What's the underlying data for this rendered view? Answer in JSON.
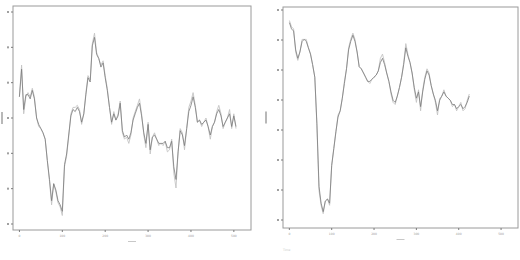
{
  "chart_data": [
    {
      "type": "line",
      "title": "",
      "xlabel": "",
      "ylabel": "",
      "x_ticks": [
        "0",
        "100",
        "200",
        "300",
        "400",
        "500"
      ],
      "xlim": [
        -15,
        540
      ],
      "ylim_pixel_ticks": 7,
      "grid": false,
      "legend": null,
      "series": [
        {
          "name": "series-light",
          "color": "#c4c4c4",
          "x": [
            0,
            5,
            10,
            15,
            20,
            25,
            30,
            35,
            40,
            45,
            50,
            55,
            60,
            65,
            70,
            75,
            80,
            85,
            90,
            95,
            100,
            105,
            110,
            115,
            120,
            125,
            130,
            135,
            140,
            145,
            150,
            155,
            160,
            165,
            170,
            175,
            180,
            185,
            190,
            195,
            200,
            205,
            210,
            215,
            220,
            225,
            230,
            235,
            240,
            245,
            250,
            255,
            260,
            265,
            270,
            275,
            280,
            285,
            290,
            295,
            300,
            305,
            310,
            315,
            320,
            325,
            330,
            335,
            340,
            345,
            350,
            355,
            360,
            365,
            370,
            375,
            380,
            385,
            390,
            395,
            400,
            405,
            410,
            415,
            420,
            425,
            430,
            435,
            440,
            445,
            450,
            455,
            460,
            465,
            470,
            475,
            480,
            485,
            490,
            495,
            500,
            505,
            510,
            515,
            520,
            525
          ],
          "y": [
            0.6,
            0.75,
            0.52,
            0.6,
            0.62,
            0.6,
            0.64,
            0.6,
            0.5,
            0.46,
            0.45,
            0.43,
            0.4,
            0.3,
            0.2,
            0.09,
            0.19,
            0.15,
            0.1,
            0.08,
            0.04,
            0.27,
            0.32,
            0.41,
            0.52,
            0.55,
            0.55,
            0.56,
            0.54,
            0.47,
            0.52,
            0.62,
            0.7,
            0.68,
            0.85,
            0.9,
            0.81,
            0.78,
            0.75,
            0.77,
            0.7,
            0.64,
            0.55,
            0.47,
            0.53,
            0.49,
            0.52,
            0.58,
            0.43,
            0.4,
            0.41,
            0.38,
            0.42,
            0.5,
            0.53,
            0.56,
            0.59,
            0.52,
            0.42,
            0.36,
            0.48,
            0.33,
            0.41,
            0.43,
            0.4,
            0.37,
            0.38,
            0.37,
            0.39,
            0.34,
            0.35,
            0.4,
            0.24,
            0.17,
            0.34,
            0.45,
            0.43,
            0.35,
            0.45,
            0.55,
            0.58,
            0.62,
            0.56,
            0.48,
            0.49,
            0.46,
            0.48,
            0.5,
            0.46,
            0.4,
            0.46,
            0.48,
            0.53,
            0.56,
            0.52,
            0.45,
            0.48,
            0.5,
            0.54,
            0.45,
            0.52,
            0.45
          ]
        },
        {
          "name": "series-dark",
          "color": "#7b7b7b",
          "x": [
            0,
            5,
            10,
            15,
            20,
            25,
            30,
            35,
            40,
            45,
            50,
            55,
            60,
            65,
            70,
            75,
            80,
            85,
            90,
            95,
            100,
            105,
            110,
            115,
            120,
            125,
            130,
            135,
            140,
            145,
            150,
            155,
            160,
            165,
            170,
            175,
            180,
            185,
            190,
            195,
            200,
            205,
            210,
            215,
            220,
            225,
            230,
            235,
            240,
            245,
            250,
            255,
            260,
            265,
            270,
            275,
            280,
            285,
            290,
            295,
            300,
            305,
            310,
            315,
            320,
            325,
            330,
            335,
            340,
            345,
            350,
            355,
            360,
            365,
            370,
            375,
            380,
            385,
            390,
            395,
            400,
            405,
            410,
            415,
            420,
            425,
            430,
            435,
            440,
            445,
            450,
            455,
            460,
            465,
            470,
            475,
            480,
            485,
            490,
            495,
            500,
            505,
            510,
            515,
            520,
            525
          ],
          "y": [
            0.6,
            0.73,
            0.54,
            0.61,
            0.61,
            0.59,
            0.63,
            0.59,
            0.5,
            0.47,
            0.45,
            0.43,
            0.4,
            0.3,
            0.21,
            0.11,
            0.19,
            0.16,
            0.11,
            0.09,
            0.06,
            0.28,
            0.33,
            0.42,
            0.51,
            0.54,
            0.53,
            0.55,
            0.53,
            0.48,
            0.52,
            0.61,
            0.69,
            0.67,
            0.84,
            0.88,
            0.8,
            0.78,
            0.74,
            0.76,
            0.69,
            0.63,
            0.55,
            0.48,
            0.52,
            0.49,
            0.51,
            0.57,
            0.44,
            0.41,
            0.42,
            0.4,
            0.43,
            0.49,
            0.52,
            0.55,
            0.57,
            0.51,
            0.43,
            0.38,
            0.47,
            0.35,
            0.41,
            0.42,
            0.4,
            0.38,
            0.38,
            0.38,
            0.39,
            0.36,
            0.36,
            0.39,
            0.27,
            0.21,
            0.34,
            0.44,
            0.42,
            0.37,
            0.45,
            0.53,
            0.56,
            0.6,
            0.55,
            0.48,
            0.49,
            0.47,
            0.48,
            0.49,
            0.46,
            0.42,
            0.46,
            0.48,
            0.52,
            0.54,
            0.51,
            0.46,
            0.48,
            0.5,
            0.52,
            0.46,
            0.51,
            0.46
          ]
        }
      ]
    },
    {
      "type": "line",
      "title": "",
      "xlabel": "",
      "ylabel": "",
      "x_ticks": [
        "0",
        "100",
        "200",
        "300",
        "400",
        "500"
      ],
      "xlim": [
        -15,
        540
      ],
      "ylim_pixel_ticks": 8,
      "grid": false,
      "legend": null,
      "series": [
        {
          "name": "series-light",
          "color": "#c4c4c4",
          "x": [
            0,
            5,
            10,
            15,
            20,
            25,
            30,
            35,
            40,
            45,
            50,
            55,
            60,
            65,
            70,
            75,
            80,
            85,
            90,
            95,
            100,
            105,
            110,
            115,
            120,
            125,
            130,
            135,
            140,
            145,
            150,
            155,
            160,
            165,
            170,
            175,
            180,
            185,
            190,
            195,
            200,
            205,
            210,
            215,
            220,
            225,
            230,
            235,
            240,
            245,
            250,
            255,
            260,
            265,
            270,
            275,
            280,
            285,
            290,
            295,
            300,
            305,
            310,
            315,
            320,
            325,
            330,
            335,
            340,
            345,
            350,
            355,
            360,
            365,
            370,
            375,
            380,
            385,
            390,
            395,
            400,
            405,
            410,
            415,
            420,
            425,
            430,
            435,
            440,
            445,
            450,
            455,
            460,
            465,
            470,
            475,
            480,
            485,
            490,
            495,
            500,
            505,
            510,
            515,
            520,
            525
          ],
          "y": [
            0.95,
            0.92,
            0.91,
            0.8,
            0.76,
            0.8,
            0.86,
            0.86,
            0.86,
            0.82,
            0.79,
            0.74,
            0.68,
            0.45,
            0.14,
            0.07,
            0.03,
            0.09,
            0.1,
            0.07,
            0.26,
            0.34,
            0.42,
            0.5,
            0.52,
            0.58,
            0.66,
            0.72,
            0.82,
            0.86,
            0.89,
            0.86,
            0.8,
            0.73,
            0.72,
            0.7,
            0.68,
            0.66,
            0.65,
            0.67,
            0.68,
            0.69,
            0.71,
            0.77,
            0.79,
            0.75,
            0.7,
            0.66,
            0.6,
            0.56,
            0.55,
            0.59,
            0.63,
            0.68,
            0.75,
            0.84,
            0.79,
            0.75,
            0.7,
            0.62,
            0.56,
            0.62,
            0.52,
            0.62,
            0.68,
            0.72,
            0.7,
            0.64,
            0.6,
            0.56,
            0.5,
            0.58,
            0.59,
            0.62,
            0.59,
            0.58,
            0.57,
            0.54,
            0.55,
            0.52,
            0.54,
            0.56,
            0.52,
            0.53,
            0.57,
            0.6
          ]
        },
        {
          "name": "series-dark",
          "color": "#7b7b7b",
          "x": [
            0,
            5,
            10,
            15,
            20,
            25,
            30,
            35,
            40,
            45,
            50,
            55,
            60,
            65,
            70,
            75,
            80,
            85,
            90,
            95,
            100,
            105,
            110,
            115,
            120,
            125,
            130,
            135,
            140,
            145,
            150,
            155,
            160,
            165,
            170,
            175,
            180,
            185,
            190,
            195,
            200,
            205,
            210,
            215,
            220,
            225,
            230,
            235,
            240,
            245,
            250,
            255,
            260,
            265,
            270,
            275,
            280,
            285,
            290,
            295,
            300,
            305,
            310,
            315,
            320,
            325,
            330,
            335,
            340,
            345,
            350,
            355,
            360,
            365,
            370,
            375,
            380,
            385,
            390,
            395,
            400,
            405,
            410,
            415,
            420,
            425,
            430,
            435,
            440,
            445,
            450,
            455,
            460,
            465,
            470,
            475,
            480,
            485,
            490,
            495,
            500,
            505,
            510,
            515,
            520,
            525
          ],
          "y": [
            0.94,
            0.91,
            0.9,
            0.81,
            0.77,
            0.8,
            0.85,
            0.86,
            0.85,
            0.82,
            0.79,
            0.74,
            0.68,
            0.46,
            0.16,
            0.08,
            0.04,
            0.09,
            0.1,
            0.08,
            0.26,
            0.34,
            0.42,
            0.49,
            0.52,
            0.58,
            0.65,
            0.72,
            0.81,
            0.85,
            0.88,
            0.85,
            0.8,
            0.73,
            0.72,
            0.7,
            0.68,
            0.66,
            0.66,
            0.67,
            0.68,
            0.69,
            0.71,
            0.75,
            0.77,
            0.74,
            0.7,
            0.66,
            0.61,
            0.57,
            0.56,
            0.59,
            0.63,
            0.68,
            0.74,
            0.82,
            0.78,
            0.75,
            0.7,
            0.63,
            0.58,
            0.61,
            0.54,
            0.61,
            0.67,
            0.71,
            0.69,
            0.64,
            0.6,
            0.57,
            0.52,
            0.57,
            0.59,
            0.61,
            0.59,
            0.58,
            0.57,
            0.55,
            0.55,
            0.53,
            0.54,
            0.55,
            0.53,
            0.54,
            0.56,
            0.59
          ]
        }
      ]
    }
  ],
  "caption": "Time"
}
